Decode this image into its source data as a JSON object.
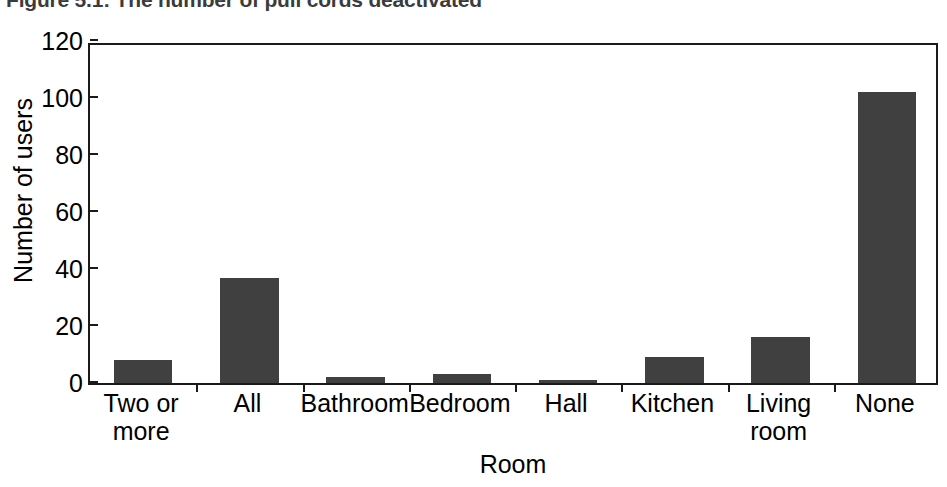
{
  "chart_data": {
    "type": "bar",
    "title": "Figure 5.1: The number of pull cords deactivated",
    "xlabel": "Room",
    "ylabel": "Number of users",
    "categories": [
      "Two or more",
      "All",
      "Bathroom",
      "Bedroom",
      "Hall",
      "Kitchen",
      "Living room",
      "None"
    ],
    "category_lines": [
      [
        "Two or",
        "more"
      ],
      [
        "All",
        ""
      ],
      [
        "Bathroom",
        ""
      ],
      [
        "Bedroom",
        ""
      ],
      [
        "Hall",
        ""
      ],
      [
        "Kitchen",
        ""
      ],
      [
        "Living",
        "room"
      ],
      [
        "None",
        ""
      ]
    ],
    "values": [
      8,
      37,
      2,
      3,
      1,
      9,
      16,
      102
    ],
    "ylim": [
      0,
      120
    ],
    "yticks": [
      0,
      20,
      40,
      60,
      80,
      100,
      120
    ],
    "ytick_labels": [
      "0",
      "20",
      "40",
      "60",
      "80",
      "100",
      "120"
    ],
    "grid": false,
    "legend": false,
    "bar_color": "#404040",
    "axis_color": "#1a1a1a",
    "title_color": "#3b3b3b",
    "background": "#ffffff"
  }
}
